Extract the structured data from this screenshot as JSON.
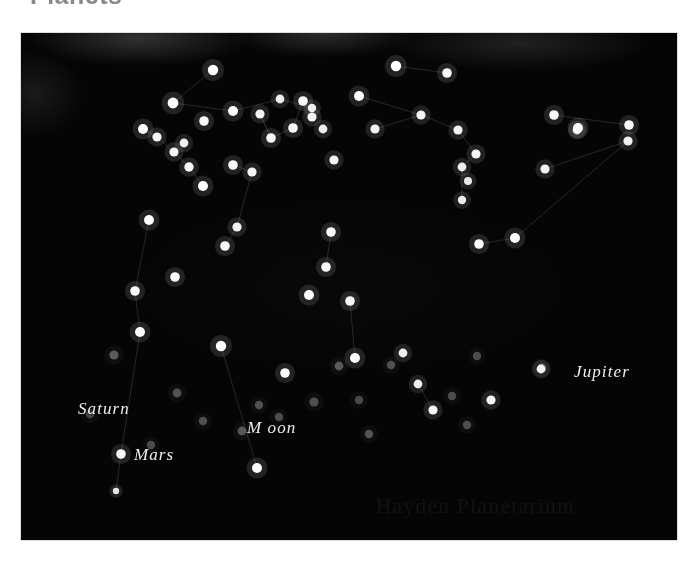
{
  "heading": {
    "text": "Planets",
    "note": "cropped at top edge of scan"
  },
  "plate": {
    "background_color": "#050505",
    "star_color": "#ffffff",
    "planet_color": "#8c8c8c",
    "line_color": "#2a2a2a",
    "credit_text": "Hayden Planetarium"
  },
  "labels": {
    "saturn": "Saturn",
    "mars": "Mars",
    "moon": "M oon",
    "jupiter": "Jupiter"
  },
  "chart_data": {
    "type": "scatter",
    "title": "Planets",
    "xlabel": "",
    "ylabel": "",
    "xlim": [
      0,
      656
    ],
    "ylim": [
      0,
      507
    ],
    "grid": false,
    "legend": "none",
    "series": [
      {
        "name": "stars",
        "color": "#ffffff",
        "points": [
          {
            "x": 192,
            "y": 37,
            "r": 5.2,
            "b": 1.0
          },
          {
            "x": 152,
            "y": 70,
            "r": 5.4,
            "b": 1.0
          },
          {
            "x": 212,
            "y": 78,
            "r": 5.0,
            "b": 0.98
          },
          {
            "x": 183,
            "y": 88,
            "r": 4.8,
            "b": 0.97
          },
          {
            "x": 239,
            "y": 81,
            "r": 4.6,
            "b": 0.95
          },
          {
            "x": 259,
            "y": 66,
            "r": 4.4,
            "b": 0.93
          },
          {
            "x": 122,
            "y": 96,
            "r": 5.0,
            "b": 0.99
          },
          {
            "x": 136,
            "y": 104,
            "r": 4.6,
            "b": 0.96
          },
          {
            "x": 153,
            "y": 119,
            "r": 4.6,
            "b": 0.96
          },
          {
            "x": 168,
            "y": 134,
            "r": 4.7,
            "b": 0.97
          },
          {
            "x": 182,
            "y": 153,
            "r": 5.0,
            "b": 0.99
          },
          {
            "x": 212,
            "y": 132,
            "r": 4.8,
            "b": 0.97
          },
          {
            "x": 231,
            "y": 139,
            "r": 4.6,
            "b": 0.95
          },
          {
            "x": 250,
            "y": 105,
            "r": 4.8,
            "b": 0.97
          },
          {
            "x": 272,
            "y": 95,
            "r": 4.8,
            "b": 0.97
          },
          {
            "x": 282,
            "y": 68,
            "r": 4.8,
            "b": 0.97
          },
          {
            "x": 291,
            "y": 84,
            "r": 4.6,
            "b": 0.95
          },
          {
            "x": 302,
            "y": 96,
            "r": 4.4,
            "b": 0.93
          },
          {
            "x": 313,
            "y": 127,
            "r": 4.6,
            "b": 0.95
          },
          {
            "x": 204,
            "y": 213,
            "r": 4.8,
            "b": 0.97
          },
          {
            "x": 216,
            "y": 194,
            "r": 4.6,
            "b": 0.95
          },
          {
            "x": 128,
            "y": 187,
            "r": 5.0,
            "b": 0.99
          },
          {
            "x": 114,
            "y": 258,
            "r": 4.8,
            "b": 0.97
          },
          {
            "x": 154,
            "y": 244,
            "r": 4.8,
            "b": 0.97
          },
          {
            "x": 119,
            "y": 299,
            "r": 5.0,
            "b": 0.99
          },
          {
            "x": 200,
            "y": 313,
            "r": 5.2,
            "b": 1.0
          },
          {
            "x": 100,
            "y": 421,
            "r": 4.8,
            "b": 0.96
          },
          {
            "x": 95,
            "y": 458,
            "r": 3.2,
            "b": 0.88
          },
          {
            "x": 236,
            "y": 435,
            "r": 5.0,
            "b": 0.99
          },
          {
            "x": 338,
            "y": 63,
            "r": 5.0,
            "b": 0.99
          },
          {
            "x": 375,
            "y": 33,
            "r": 5.2,
            "b": 1.0
          },
          {
            "x": 426,
            "y": 40,
            "r": 4.8,
            "b": 0.97
          },
          {
            "x": 400,
            "y": 82,
            "r": 4.6,
            "b": 0.95
          },
          {
            "x": 437,
            "y": 97,
            "r": 4.6,
            "b": 0.95
          },
          {
            "x": 455,
            "y": 121,
            "r": 4.6,
            "b": 0.95
          },
          {
            "x": 441,
            "y": 134,
            "r": 4.4,
            "b": 0.93
          },
          {
            "x": 447,
            "y": 148,
            "r": 4.0,
            "b": 0.9
          },
          {
            "x": 441,
            "y": 167,
            "r": 4.2,
            "b": 0.91
          },
          {
            "x": 354,
            "y": 96,
            "r": 4.6,
            "b": 0.95
          },
          {
            "x": 310,
            "y": 199,
            "r": 4.8,
            "b": 0.97
          },
          {
            "x": 305,
            "y": 234,
            "r": 4.8,
            "b": 0.97
          },
          {
            "x": 288,
            "y": 262,
            "r": 5.0,
            "b": 0.99
          },
          {
            "x": 329,
            "y": 268,
            "r": 4.8,
            "b": 0.97
          },
          {
            "x": 334,
            "y": 325,
            "r": 5.0,
            "b": 0.98
          },
          {
            "x": 382,
            "y": 320,
            "r": 4.4,
            "b": 0.93
          },
          {
            "x": 397,
            "y": 351,
            "r": 4.4,
            "b": 0.93
          },
          {
            "x": 412,
            "y": 377,
            "r": 4.6,
            "b": 0.95
          },
          {
            "x": 458,
            "y": 211,
            "r": 4.8,
            "b": 0.97
          },
          {
            "x": 494,
            "y": 205,
            "r": 5.0,
            "b": 0.99
          },
          {
            "x": 533,
            "y": 82,
            "r": 4.8,
            "b": 0.97
          },
          {
            "x": 557,
            "y": 95,
            "r": 5.0,
            "b": 0.99
          },
          {
            "x": 524,
            "y": 136,
            "r": 4.6,
            "b": 0.95
          },
          {
            "x": 556,
            "y": 97,
            "r": 4.4,
            "b": 0.93
          },
          {
            "x": 608,
            "y": 92,
            "r": 4.8,
            "b": 0.97
          },
          {
            "x": 607,
            "y": 108,
            "r": 4.6,
            "b": 0.95
          },
          {
            "x": 470,
            "y": 367,
            "r": 4.6,
            "b": 0.95
          },
          {
            "x": 520,
            "y": 336,
            "r": 4.4,
            "b": 0.93
          },
          {
            "x": 291,
            "y": 75,
            "r": 4.2,
            "b": 0.92
          },
          {
            "x": 163,
            "y": 110,
            "r": 4.4,
            "b": 0.93
          },
          {
            "x": 264,
            "y": 340,
            "r": 4.8,
            "b": 0.97
          }
        ]
      },
      {
        "name": "planets",
        "color": "#8c8c8c",
        "points": [
          {
            "x": 69,
            "y": 381,
            "r": 4.4,
            "b": 0.46,
            "label": "Saturn"
          },
          {
            "x": 130,
            "y": 412,
            "r": 4.2,
            "b": 0.5,
            "label": "Mars"
          },
          {
            "x": 293,
            "y": 369,
            "r": 4.6,
            "b": 0.52,
            "label": "Moon"
          },
          {
            "x": 521,
            "y": 335,
            "r": 4.4,
            "b": 0.54,
            "label": "Jupiter"
          },
          {
            "x": 93,
            "y": 322,
            "r": 4.6,
            "b": 0.62
          },
          {
            "x": 156,
            "y": 360,
            "r": 4.4,
            "b": 0.55
          },
          {
            "x": 182,
            "y": 388,
            "r": 4.2,
            "b": 0.52
          },
          {
            "x": 221,
            "y": 398,
            "r": 4.4,
            "b": 0.58
          },
          {
            "x": 238,
            "y": 372,
            "r": 4.2,
            "b": 0.54
          },
          {
            "x": 258,
            "y": 384,
            "r": 4.2,
            "b": 0.5
          },
          {
            "x": 318,
            "y": 333,
            "r": 4.4,
            "b": 0.6
          },
          {
            "x": 338,
            "y": 367,
            "r": 4.2,
            "b": 0.48
          },
          {
            "x": 370,
            "y": 332,
            "r": 4.2,
            "b": 0.52
          },
          {
            "x": 348,
            "y": 401,
            "r": 4.2,
            "b": 0.56
          },
          {
            "x": 431,
            "y": 363,
            "r": 4.2,
            "b": 0.5
          },
          {
            "x": 446,
            "y": 392,
            "r": 4.2,
            "b": 0.52
          },
          {
            "x": 456,
            "y": 323,
            "r": 4.2,
            "b": 0.5
          }
        ]
      }
    ],
    "connections": [
      [
        192,
        37,
        152,
        70
      ],
      [
        152,
        70,
        212,
        78
      ],
      [
        212,
        78,
        259,
        66
      ],
      [
        259,
        66,
        291,
        75
      ],
      [
        239,
        81,
        250,
        105
      ],
      [
        250,
        105,
        272,
        95
      ],
      [
        272,
        95,
        282,
        68
      ],
      [
        122,
        96,
        136,
        104
      ],
      [
        136,
        104,
        153,
        119
      ],
      [
        153,
        119,
        168,
        134
      ],
      [
        168,
        134,
        182,
        153
      ],
      [
        212,
        132,
        231,
        139
      ],
      [
        231,
        139,
        216,
        194
      ],
      [
        216,
        194,
        204,
        213
      ],
      [
        128,
        187,
        114,
        258
      ],
      [
        114,
        258,
        119,
        299
      ],
      [
        119,
        299,
        100,
        421
      ],
      [
        100,
        421,
        95,
        458
      ],
      [
        200,
        313,
        236,
        435
      ],
      [
        250,
        105,
        239,
        81
      ],
      [
        375,
        33,
        426,
        40
      ],
      [
        338,
        63,
        400,
        82
      ],
      [
        400,
        82,
        437,
        97
      ],
      [
        437,
        97,
        455,
        121
      ],
      [
        455,
        121,
        441,
        134
      ],
      [
        441,
        134,
        441,
        167
      ],
      [
        354,
        96,
        400,
        82
      ],
      [
        310,
        199,
        305,
        234
      ],
      [
        458,
        211,
        494,
        205
      ],
      [
        494,
        205,
        607,
        108
      ],
      [
        524,
        136,
        607,
        108
      ],
      [
        533,
        82,
        608,
        92
      ],
      [
        334,
        325,
        329,
        268
      ],
      [
        412,
        377,
        397,
        351
      ]
    ]
  }
}
